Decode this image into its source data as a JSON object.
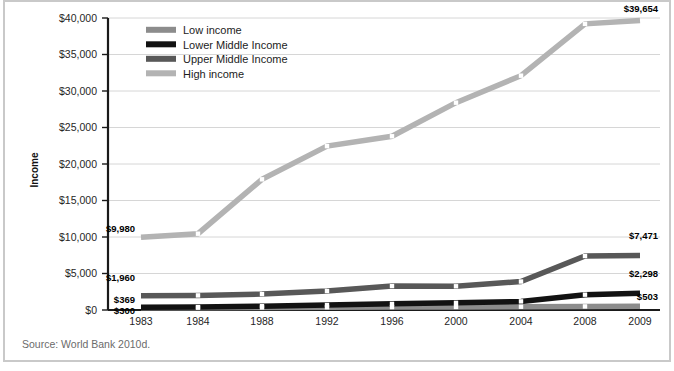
{
  "figure": {
    "source_note": "Source: World Bank 2010d.",
    "y_axis_title": "Income"
  },
  "chart_data": {
    "type": "line",
    "title": "",
    "xlabel": "",
    "ylabel": "Income",
    "grid": true,
    "legend_position": "top-left",
    "ylim": [
      0,
      40000
    ],
    "y_ticks": [
      0,
      5000,
      10000,
      15000,
      20000,
      25000,
      30000,
      35000,
      40000
    ],
    "y_tick_labels": [
      "$0",
      "$5,000",
      "$10,000",
      "$15,000",
      "$20,000",
      "$25,000",
      "$30,000",
      "$35,000",
      "$40,000"
    ],
    "categories": [
      "1983",
      "1984",
      "1988",
      "1992",
      "1996",
      "2000",
      "2004",
      "2008",
      "2009"
    ],
    "series": [
      {
        "name": "Low income",
        "color": "#8c8c8c",
        "values": [
          300,
          320,
          350,
          380,
          400,
          420,
          450,
          490,
          503
        ],
        "start_label": "$300",
        "end_label": "$503"
      },
      {
        "name": "Lower Middle Income",
        "color": "#121212",
        "values": [
          369,
          400,
          520,
          680,
          840,
          980,
          1180,
          2100,
          2298
        ],
        "start_label": "$369",
        "end_label": "$2,298"
      },
      {
        "name": "Upper Middle Income",
        "color": "#585858",
        "values": [
          1960,
          2000,
          2180,
          2600,
          3280,
          3250,
          3900,
          7400,
          7471
        ],
        "start_label": "$1,960",
        "end_label": "$7,471"
      },
      {
        "name": "High income",
        "color": "#b3b3b3",
        "values": [
          9980,
          10450,
          17900,
          22450,
          23800,
          28400,
          32100,
          39200,
          39654
        ],
        "start_label": "$9,980",
        "end_label": "$39,654"
      }
    ]
  }
}
